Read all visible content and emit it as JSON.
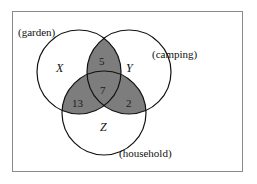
{
  "figure": {
    "type": "venn-3-set",
    "frame": {
      "border_color": "#8a8a8a",
      "background": "#ffffff"
    },
    "style": {
      "circle_stroke": "#111111",
      "shaded_fill": "#7d7d7d",
      "unshaded_fill": "#ffffff",
      "text_color": "#111111"
    }
  },
  "sets": [
    {
      "id": "X",
      "letter": "X",
      "context_label": "(garden)",
      "cx": 79,
      "cy": 72,
      "r": 42
    },
    {
      "id": "Y",
      "letter": "Y",
      "context_label": "(camping)",
      "cx": 129,
      "cy": 72,
      "r": 42
    },
    {
      "id": "Z",
      "letter": "Z",
      "context_label": "(household)",
      "cx": 104,
      "cy": 113,
      "r": 42
    }
  ],
  "regions": [
    {
      "id": "XY_only",
      "label": "5",
      "shaded": true,
      "x": 103,
      "y": 61
    },
    {
      "id": "XYZ",
      "label": "7",
      "shaded": true,
      "x": 104,
      "y": 90
    },
    {
      "id": "XZ_only",
      "label": "13",
      "shaded": true,
      "x": 79,
      "y": 103
    },
    {
      "id": "YZ_only",
      "label": "2",
      "shaded": true,
      "x": 129,
      "y": 103
    },
    {
      "id": "X_only",
      "label": "",
      "shaded": false,
      "x": 62,
      "y": 68
    },
    {
      "id": "Y_only",
      "label": "",
      "shaded": false,
      "x": 146,
      "y": 68
    },
    {
      "id": "Z_only",
      "label": "",
      "shaded": false,
      "x": 104,
      "y": 128
    }
  ],
  "chart_data": {
    "type": "venn",
    "title": "",
    "set_names": [
      "X",
      "Y",
      "Z"
    ],
    "set_context": [
      "(garden)",
      "(camping)",
      "(household)"
    ],
    "values": {
      "X_only": null,
      "Y_only": null,
      "Z_only": null,
      "X_and_Y_only": 5,
      "X_and_Z_only": 13,
      "Y_and_Z_only": 2,
      "X_and_Y_and_Z": 7
    },
    "shaded_regions": [
      "X_and_Y_only",
      "X_and_Z_only",
      "Y_and_Z_only",
      "X_and_Y_and_Z"
    ],
    "annotations": [
      "5",
      "7",
      "13",
      "2"
    ],
    "legend": "none",
    "grid": false
  },
  "labels": {
    "garden": "(garden)",
    "camping": "(camping)",
    "household": "(household)",
    "set_x": "X",
    "set_y": "Y",
    "set_z": "Z",
    "n_xy": "5",
    "n_xyz": "7",
    "n_xz": "13",
    "n_yz": "2"
  },
  "label_positions": {
    "garden": {
      "left": 18,
      "top": 27
    },
    "camping": {
      "left": 152,
      "top": 49
    },
    "household": {
      "left": 119,
      "top": 148
    },
    "set_x": {
      "left": 56,
      "top": 62
    },
    "set_y": {
      "left": 126,
      "top": 62
    },
    "set_z": {
      "left": 100,
      "top": 121
    },
    "n_xy": {
      "left": 99,
      "top": 56
    },
    "n_xyz": {
      "left": 100,
      "top": 85
    },
    "n_xz": {
      "left": 72,
      "top": 98
    },
    "n_yz": {
      "left": 126,
      "top": 98
    }
  }
}
